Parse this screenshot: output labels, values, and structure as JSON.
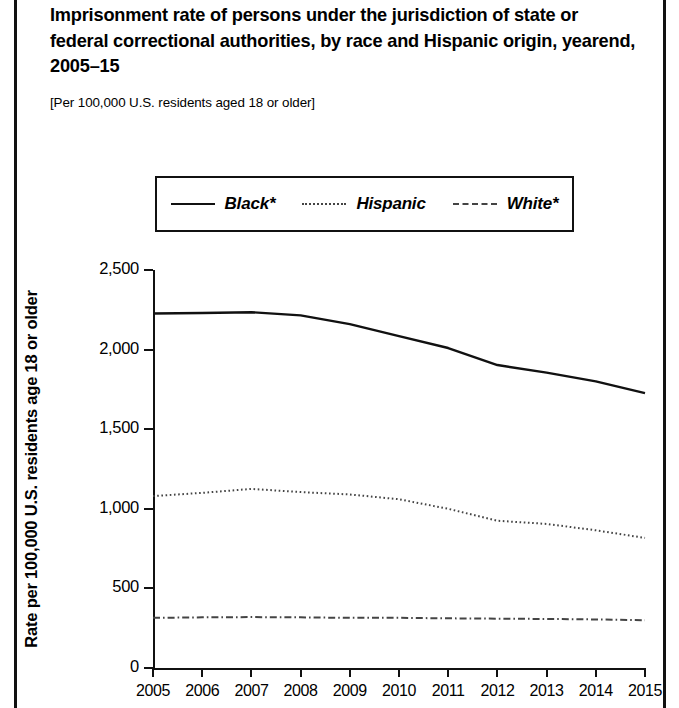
{
  "figure": {
    "title": "Imprisonment rate of persons under the jurisdiction of state or federal correctional authorities, by race and Hispanic origin, yearend, 2005–15",
    "subtitle": "[Per 100,000 U.S. residents aged 18 or older]"
  },
  "legend": {
    "position": "top-center",
    "items": [
      {
        "label": "Black*",
        "style": "solid",
        "color": "#111111"
      },
      {
        "label": "Hispanic",
        "style": "dotted",
        "color": "#444444"
      },
      {
        "label": "White*",
        "style": "dash-dot",
        "color": "#444444"
      }
    ]
  },
  "axes": {
    "ylabel": "Rate per 100,000 U.S. residents age 18 or older",
    "yticks": [
      "0",
      "500",
      "1,000",
      "1,500",
      "2,000",
      "2,500"
    ],
    "xticks": [
      "2005",
      "2006",
      "2007",
      "2008",
      "2009",
      "2010",
      "2011",
      "2012",
      "2013",
      "2014",
      "2015"
    ]
  },
  "chart_data": {
    "type": "line",
    "title": "Imprisonment rate of persons under the jurisdiction of state or federal correctional authorities, by race and Hispanic origin, yearend, 2005–15",
    "subtitle": "[Per 100,000 U.S. residents aged 18 or older]",
    "xlabel": "",
    "ylabel": "Rate per 100,000 U.S. residents age 18 or older",
    "x": [
      2005,
      2006,
      2007,
      2008,
      2009,
      2010,
      2011,
      2012,
      2013,
      2014,
      2015
    ],
    "ylim": [
      0,
      2500
    ],
    "xlim": [
      2005,
      2015
    ],
    "ytick_values": [
      0,
      500,
      1000,
      1500,
      2000,
      2500
    ],
    "grid": false,
    "series": [
      {
        "name": "Black*",
        "style": "solid",
        "color": "#111111",
        "values": [
          2227,
          2230,
          2235,
          2215,
          2160,
          2085,
          2010,
          1903,
          1855,
          1800,
          1727
        ]
      },
      {
        "name": "Hispanic",
        "style": "dotted",
        "color": "#444444",
        "values": [
          1080,
          1100,
          1125,
          1105,
          1090,
          1060,
          1000,
          925,
          905,
          865,
          817
        ]
      },
      {
        "name": "White*",
        "style": "dash-dot",
        "color": "#444444",
        "values": [
          315,
          318,
          320,
          318,
          315,
          315,
          312,
          310,
          308,
          305,
          300
        ]
      }
    ]
  }
}
